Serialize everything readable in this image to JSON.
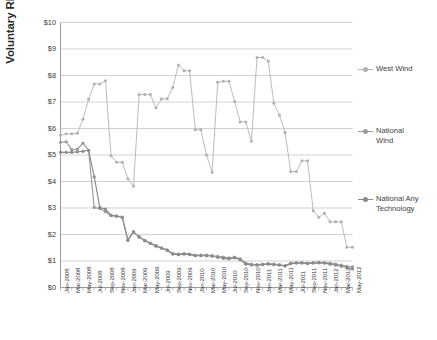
{
  "chart_data": {
    "type": "line",
    "title": "",
    "xlabel": "",
    "ylabel": "Voluntary REC price ($/MWh)",
    "ylim": [
      0,
      10
    ],
    "ytick_values": [
      0,
      1,
      2,
      3,
      4,
      5,
      6,
      7,
      8,
      9,
      10
    ],
    "ytick_labels": [
      "$0",
      "$1",
      "$2",
      "$3",
      "$4",
      "$5",
      "$6",
      "$7",
      "$8",
      "$9",
      "$10"
    ],
    "grid": "horizontal",
    "legend_position": "right",
    "marker": "circle",
    "x": [
      "Jan-2008",
      "Feb-2008",
      "Mar-2008",
      "Apr-2008",
      "May-2008",
      "Jun-2008",
      "Jul-2008",
      "Aug-2008",
      "Sep-2008",
      "Oct-2008",
      "Nov-2008",
      "Dec-2008",
      "Jan-2009",
      "Feb-2009",
      "Mar-2009",
      "Apr-2009",
      "May-2009",
      "Jun-2009",
      "Jul-2009",
      "Aug-2009",
      "Sep-2009",
      "Oct-2009",
      "Nov-2009",
      "Dec-2009",
      "Jan-2010",
      "Feb-2010",
      "Mar-2010",
      "Apr-2010",
      "May-2010",
      "Jun-2010",
      "Jul-2010",
      "Aug-2010",
      "Sep-2010",
      "Oct-2010",
      "Nov-2010",
      "Dec-2010",
      "Jan-2011",
      "Feb-2011",
      "Mar-2011",
      "Apr-2011",
      "May-2011",
      "Jun-2011",
      "Jul-2011",
      "Aug-2011",
      "Sep-2011",
      "Oct-2011",
      "Nov-2011",
      "Dec-2011",
      "Jan-2012",
      "Feb-2012",
      "Mar-2012",
      "Apr-2012",
      "May-2012"
    ],
    "xtick_labels": [
      "Jan-2008",
      "Mar-2008",
      "May-2008",
      "Jul-2008",
      "Sep-2008",
      "Nov-2008",
      "Jan-2009",
      "Mar-2009",
      "May-2009",
      "Jul-2009",
      "Sep-2009",
      "Nov-2009",
      "Jan-2010",
      "Mar-2010",
      "May-2010",
      "Jul-2010",
      "Sep-2010",
      "Nov-2010",
      "Jan-2011",
      "Mar-2011",
      "May-2011",
      "Jul-2011",
      "Sep-2011",
      "Nov-2011",
      "Jan-2012",
      "Mar-2012",
      "May-2012"
    ],
    "series": [
      {
        "name": "West Wind",
        "color": "#b0b0b0",
        "values": [
          5.75,
          5.8,
          5.8,
          5.82,
          6.35,
          7.1,
          7.68,
          7.68,
          7.8,
          4.97,
          4.73,
          4.73,
          4.1,
          3.82,
          7.28,
          7.28,
          7.28,
          6.78,
          7.12,
          7.12,
          7.55,
          8.4,
          8.18,
          8.18,
          5.95,
          5.95,
          5.0,
          4.35,
          7.75,
          7.78,
          7.78,
          7.02,
          6.25,
          6.25,
          5.52,
          8.68,
          8.68,
          8.55,
          6.95,
          6.5,
          5.85,
          4.38,
          4.38,
          4.78,
          4.78,
          2.9,
          2.65,
          2.8,
          2.48,
          2.48,
          2.48,
          1.52,
          1.52
        ]
      },
      {
        "name": "National Wind",
        "color": "#9a9a9a",
        "values": [
          5.48,
          5.5,
          5.2,
          5.22,
          5.45,
          5.18,
          3.02,
          2.98,
          2.86,
          2.72,
          2.68,
          2.66,
          1.8,
          2.1,
          1.92,
          1.78,
          1.68,
          1.58,
          1.5,
          1.42,
          1.28,
          1.26,
          1.28,
          1.26,
          1.22,
          1.22,
          1.22,
          1.2,
          1.18,
          1.15,
          1.12,
          1.15,
          1.08,
          0.92,
          0.88,
          0.86,
          0.88,
          0.9,
          0.88,
          0.86,
          0.83,
          0.92,
          0.94,
          0.94,
          0.92,
          0.94,
          0.95,
          0.94,
          0.92,
          0.88,
          0.85,
          0.8,
          0.78
        ]
      },
      {
        "name": "National Any Technology",
        "color": "#8a8a8a",
        "values": [
          5.1,
          5.1,
          5.1,
          5.12,
          5.14,
          5.18,
          4.18,
          3.02,
          2.96,
          2.72,
          2.7,
          2.64,
          1.78,
          2.1,
          1.9,
          1.76,
          1.66,
          1.56,
          1.48,
          1.4,
          1.26,
          1.24,
          1.26,
          1.24,
          1.2,
          1.2,
          1.2,
          1.18,
          1.14,
          1.1,
          1.08,
          1.12,
          1.05,
          0.88,
          0.85,
          0.84,
          0.86,
          0.88,
          0.86,
          0.84,
          0.81,
          0.9,
          0.92,
          0.92,
          0.9,
          0.92,
          0.93,
          0.92,
          0.88,
          0.84,
          0.8,
          0.76,
          0.7
        ]
      }
    ]
  },
  "legend": {
    "entries": [
      {
        "label": "West Wind"
      },
      {
        "label": "National\nWind"
      },
      {
        "label": "National Any\nTechnology"
      }
    ]
  },
  "axis": {
    "y_title": "Voluntary REC price ($/MWh)"
  },
  "colors": {
    "grid": "#c8c8c8",
    "axis": "#9b9b9b",
    "text": "#3d3d3d",
    "series_west_wind": "#b0b0b0",
    "series_national_wind": "#9a9a9a",
    "series_national_any": "#8a8a8a"
  }
}
